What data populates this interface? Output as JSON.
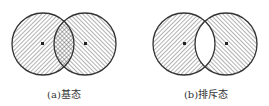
{
  "figures": [
    {
      "id": "a",
      "caption": "(a)基态",
      "state": "ground",
      "overlap_fill": "crosshatch",
      "circles": [
        {
          "cx": 43,
          "cy": 44,
          "r": 31,
          "hatch": "backslash"
        },
        {
          "cx": 85,
          "cy": 44,
          "r": 31,
          "hatch": "slash"
        }
      ]
    },
    {
      "id": "b",
      "caption": "(b)排斥态",
      "state": "repulsive",
      "overlap_fill": "empty",
      "circles": [
        {
          "cx": 184,
          "cy": 44,
          "r": 31,
          "hatch": "backslash"
        },
        {
          "cx": 226,
          "cy": 44,
          "r": 31,
          "hatch": "slash"
        }
      ]
    }
  ],
  "colors": {
    "stroke": "#333333",
    "hatch": "#555555",
    "background": "#ffffff"
  }
}
